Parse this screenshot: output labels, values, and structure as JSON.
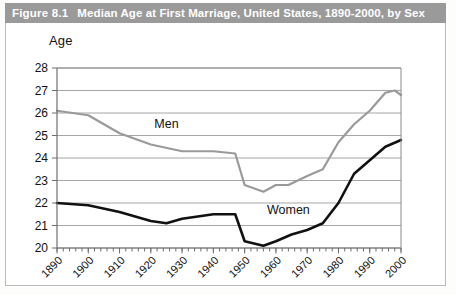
{
  "figure": {
    "number_label": "Figure 8.1",
    "title": "Median Age at First Marriage, United States, 1890-2000, by Sex"
  },
  "colors": {
    "title_bar_bg": "#9a9a9a",
    "title_text": "#ffffff",
    "men_line": "#9a9a9a",
    "women_line": "#111111",
    "gridline": "#9c9c9c",
    "frame": "#b9b9b9",
    "plot_background": "#ffffff"
  },
  "chart_data": {
    "type": "line",
    "title": "Median Age at First Marriage, United States, 1890-2000, by Sex",
    "xlabel": "",
    "ylabel": "Age",
    "ylim": [
      20,
      28
    ],
    "xlim": [
      1890,
      2000
    ],
    "y_ticks": [
      20,
      21,
      22,
      23,
      24,
      25,
      26,
      27,
      28
    ],
    "x_ticks": [
      1890,
      1900,
      1910,
      1920,
      1930,
      1940,
      1950,
      1960,
      1970,
      1980,
      1990,
      2000
    ],
    "x_minor_tick_interval": 2,
    "grid": true,
    "legend": "inline-labels",
    "series": [
      {
        "name": "Men",
        "color": "#9a9a9a",
        "label_position": {
          "x": 1925,
          "y": 25.35
        },
        "x": [
          1890,
          1900,
          1910,
          1920,
          1930,
          1940,
          1947,
          1950,
          1956,
          1960,
          1964,
          1970,
          1975,
          1980,
          1985,
          1990,
          1995,
          1998,
          2000
        ],
        "values": [
          26.1,
          25.9,
          25.1,
          24.6,
          24.3,
          24.3,
          24.2,
          22.8,
          22.5,
          22.8,
          22.8,
          23.2,
          23.5,
          24.7,
          25.5,
          26.1,
          26.9,
          27.0,
          26.8
        ]
      },
      {
        "name": "Women",
        "color": "#111111",
        "label_position": {
          "x": 1964,
          "y": 21.5
        },
        "x": [
          1890,
          1900,
          1910,
          1920,
          1925,
          1930,
          1935,
          1940,
          1947,
          1950,
          1956,
          1960,
          1965,
          1970,
          1975,
          1980,
          1985,
          1990,
          1995,
          2000
        ],
        "values": [
          22.0,
          21.9,
          21.6,
          21.2,
          21.1,
          21.3,
          21.4,
          21.5,
          21.5,
          20.3,
          20.1,
          20.3,
          20.6,
          20.8,
          21.1,
          22.0,
          23.3,
          23.9,
          24.5,
          24.8
        ]
      }
    ]
  }
}
